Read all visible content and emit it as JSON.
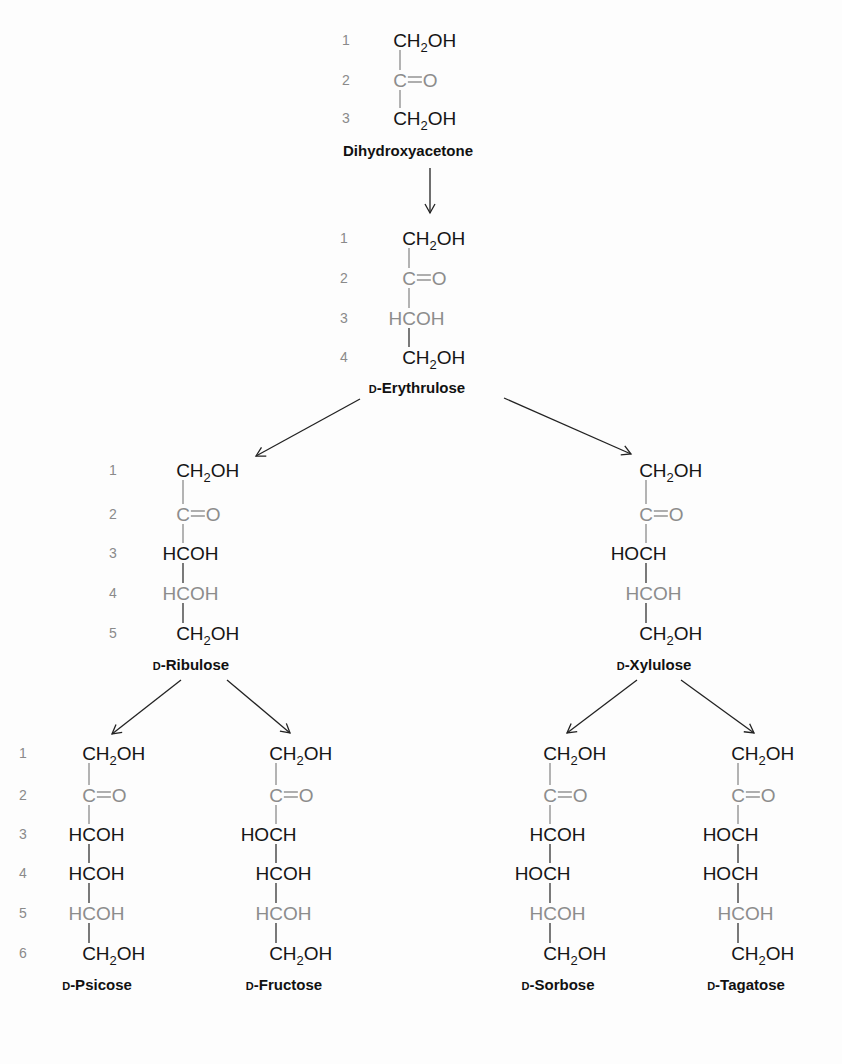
{
  "colors": {
    "black": "#151515",
    "gray": "#8c8c8c",
    "bond": "#333333",
    "grayBond": "#8c8c8c"
  },
  "molecules": [
    {
      "id": "dihydroxyacetone",
      "name_prefix": "",
      "name": "Dihydroxyacetone",
      "cx": 400,
      "numx": 346,
      "rows": [
        40,
        80,
        118
      ],
      "label_y": 156,
      "groups": [
        {
          "num": "1",
          "type": "CH2OH",
          "gray": false
        },
        {
          "num": "2",
          "type": "C=O",
          "gray": true
        },
        {
          "num": "3",
          "type": "CH2OH",
          "gray": false
        }
      ]
    },
    {
      "id": "d-erythrulose",
      "name_prefix": "D",
      "name": "-Erythrulose",
      "cx": 409,
      "numx": 344,
      "rows": [
        238,
        278,
        318,
        357
      ],
      "label_y": 393,
      "groups": [
        {
          "num": "1",
          "type": "CH2OH",
          "gray": false
        },
        {
          "num": "2",
          "type": "C=O",
          "gray": true
        },
        {
          "num": "3",
          "type": "HCOH",
          "gray": true
        },
        {
          "num": "4",
          "type": "CH2OH",
          "gray": false
        }
      ]
    },
    {
      "id": "d-ribulose",
      "name_prefix": "D",
      "name": "-Ribulose",
      "cx": 183,
      "numx": 113,
      "rows": [
        470,
        514,
        553,
        593,
        633
      ],
      "label_y": 670,
      "groups": [
        {
          "num": "1",
          "type": "CH2OH",
          "gray": false
        },
        {
          "num": "2",
          "type": "C=O",
          "gray": true
        },
        {
          "num": "3",
          "type": "HCOH",
          "gray": false
        },
        {
          "num": "4",
          "type": "HCOH",
          "gray": true
        },
        {
          "num": "5",
          "type": "CH2OH",
          "gray": false
        }
      ]
    },
    {
      "id": "d-xylulose",
      "name_prefix": "D",
      "name": "-Xylulose",
      "cx": 646,
      "numx": null,
      "rows": [
        470,
        514,
        553,
        593,
        633
      ],
      "label_y": 670,
      "groups": [
        {
          "num": "",
          "type": "CH2OH",
          "gray": false
        },
        {
          "num": "",
          "type": "C=O",
          "gray": true
        },
        {
          "num": "",
          "type": "HOCH",
          "gray": false
        },
        {
          "num": "",
          "type": "HCOH",
          "gray": true
        },
        {
          "num": "",
          "type": "CH2OH",
          "gray": false
        }
      ]
    },
    {
      "id": "d-psicose",
      "name_prefix": "D",
      "name": "-Psicose",
      "cx": 89,
      "numx": 23,
      "rows": [
        753,
        795,
        834,
        873,
        913,
        953
      ],
      "label_y": 990,
      "groups": [
        {
          "num": "1",
          "type": "CH2OH",
          "gray": false
        },
        {
          "num": "2",
          "type": "C=O",
          "gray": true
        },
        {
          "num": "3",
          "type": "HCOH",
          "gray": false
        },
        {
          "num": "4",
          "type": "HCOH",
          "gray": false
        },
        {
          "num": "5",
          "type": "HCOH",
          "gray": true
        },
        {
          "num": "6",
          "type": "CH2OH",
          "gray": false
        }
      ]
    },
    {
      "id": "d-fructose",
      "name_prefix": "D",
      "name": "-Fructose",
      "cx": 276,
      "numx": null,
      "rows": [
        753,
        795,
        834,
        873,
        913,
        953
      ],
      "label_y": 990,
      "groups": [
        {
          "num": "",
          "type": "CH2OH",
          "gray": false
        },
        {
          "num": "",
          "type": "C=O",
          "gray": true
        },
        {
          "num": "",
          "type": "HOCH",
          "gray": false
        },
        {
          "num": "",
          "type": "HCOH",
          "gray": false
        },
        {
          "num": "",
          "type": "HCOH",
          "gray": true
        },
        {
          "num": "",
          "type": "CH2OH",
          "gray": false
        }
      ]
    },
    {
      "id": "d-sorbose",
      "name_prefix": "D",
      "name": "-Sorbose",
      "cx": 550,
      "numx": null,
      "rows": [
        753,
        795,
        834,
        873,
        913,
        953
      ],
      "label_y": 990,
      "groups": [
        {
          "num": "",
          "type": "CH2OH",
          "gray": false
        },
        {
          "num": "",
          "type": "C=O",
          "gray": true
        },
        {
          "num": "",
          "type": "HCOH",
          "gray": false
        },
        {
          "num": "",
          "type": "HOCH",
          "gray": false
        },
        {
          "num": "",
          "type": "HCOH",
          "gray": true
        },
        {
          "num": "",
          "type": "CH2OH",
          "gray": false
        }
      ]
    },
    {
      "id": "d-tagatose",
      "name_prefix": "D",
      "name": "-Tagatose",
      "cx": 738,
      "numx": null,
      "rows": [
        753,
        795,
        834,
        873,
        913,
        953
      ],
      "label_y": 990,
      "groups": [
        {
          "num": "",
          "type": "CH2OH",
          "gray": false
        },
        {
          "num": "",
          "type": "C=O",
          "gray": true
        },
        {
          "num": "",
          "type": "HOCH",
          "gray": false
        },
        {
          "num": "",
          "type": "HOCH",
          "gray": false
        },
        {
          "num": "",
          "type": "HCOH",
          "gray": true
        },
        {
          "num": "",
          "type": "CH2OH",
          "gray": false
        }
      ]
    }
  ],
  "arrows": [
    {
      "from": "dihydroxyacetone",
      "to": "d-erythrulose",
      "x1": 430,
      "y1": 168,
      "x2": 430,
      "y2": 213
    },
    {
      "from": "d-erythrulose",
      "to": "d-ribulose",
      "x1": 360,
      "y1": 399,
      "x2": 256,
      "y2": 456
    },
    {
      "from": "d-erythrulose",
      "to": "d-xylulose",
      "x1": 504,
      "y1": 398,
      "x2": 631,
      "y2": 454
    },
    {
      "from": "d-ribulose",
      "to": "d-psicose",
      "x1": 181,
      "y1": 680,
      "x2": 112,
      "y2": 734
    },
    {
      "from": "d-ribulose",
      "to": "d-fructose",
      "x1": 227,
      "y1": 680,
      "x2": 290,
      "y2": 733
    },
    {
      "from": "d-xylulose",
      "to": "d-sorbose",
      "x1": 637,
      "y1": 680,
      "x2": 567,
      "y2": 733
    },
    {
      "from": "d-xylulose",
      "to": "d-tagatose",
      "x1": 681,
      "y1": 680,
      "x2": 754,
      "y2": 733
    }
  ]
}
